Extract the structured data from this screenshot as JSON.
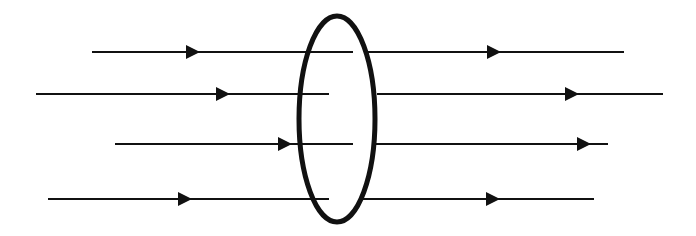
{
  "diagram": {
    "colors": {
      "stroke": "#111111",
      "background": "#ffffff"
    },
    "loop": {
      "cx": 337,
      "cy": 119,
      "rx": 38,
      "ry": 103,
      "stroke_width": 5
    },
    "field_lines": [
      {
        "y": 52,
        "left": {
          "x1": 92,
          "x2": 353,
          "arrow_x": 200
        },
        "right": {
          "x1": 368,
          "x2": 624,
          "arrow_x": 501
        }
      },
      {
        "y": 94,
        "left": {
          "x1": 36,
          "x2": 329,
          "arrow_x": 230
        },
        "right": {
          "x1": 377,
          "x2": 663,
          "arrow_x": 579
        }
      },
      {
        "y": 144,
        "left": {
          "x1": 115,
          "x2": 353,
          "arrow_x": 292
        },
        "right": {
          "x1": 375,
          "x2": 608,
          "arrow_x": 591
        }
      },
      {
        "y": 199,
        "left": {
          "x1": 48,
          "x2": 329,
          "arrow_x": 192
        },
        "right": {
          "x1": 363,
          "x2": 594,
          "arrow_x": 500
        }
      }
    ],
    "direction": "left-to-right"
  }
}
